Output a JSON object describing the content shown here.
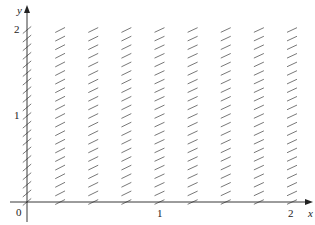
{
  "chart_data": {
    "type": "direction-field",
    "title": "",
    "xlabel": "x",
    "ylabel": "y",
    "xlim": [
      0,
      2
    ],
    "ylim": [
      0,
      2
    ],
    "x_ticks": [
      {
        "value": 0,
        "label": "0"
      },
      {
        "value": 1,
        "label": "1"
      },
      {
        "value": 2,
        "label": "2"
      }
    ],
    "y_ticks": [
      {
        "value": 1,
        "label": "1"
      },
      {
        "value": 2,
        "label": "2"
      }
    ],
    "grid": false,
    "legend": null,
    "grid_points": {
      "x": [
        0,
        0.25,
        0.5,
        0.75,
        1.0,
        1.25,
        1.5,
        1.75,
        2.0
      ],
      "y": [
        0,
        0.1,
        0.2,
        0.3,
        0.4,
        0.5,
        0.6,
        0.7,
        0.8,
        0.9,
        1.0,
        1.1,
        1.2,
        1.3,
        1.4,
        1.5,
        1.6,
        1.7,
        1.8,
        1.9,
        2.0
      ]
    },
    "segment_angle_deg_by_column": [
      40,
      27,
      26,
      26,
      25,
      25,
      25,
      25,
      25
    ]
  },
  "colors": {
    "axis": "#222222",
    "segment": "#555555"
  },
  "labels": {
    "origin": "0",
    "x_axis_name": "x",
    "y_axis_name": "y"
  }
}
